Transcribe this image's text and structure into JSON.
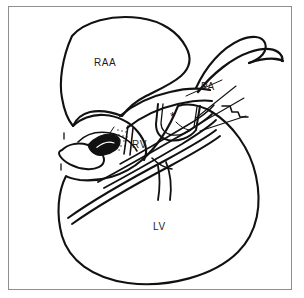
{
  "figure": {
    "kind": "medical-line-drawing",
    "background_color": "#ffffff",
    "ink_color": "#111111",
    "frame_color": "#8e8e8e",
    "label_color": "#1d1d1d"
  },
  "labels": [
    {
      "id": "raa",
      "text": "RAA",
      "meaning": "right-atrial-appendage"
    },
    {
      "id": "pa",
      "text": "PA",
      "meaning": "pulmonary-artery"
    },
    {
      "id": "rv",
      "text": "RV",
      "meaning": "right-ventricle"
    },
    {
      "id": "lv",
      "text": "LV",
      "meaning": "left-ventricle"
    }
  ],
  "markers": [
    {
      "id": "asterisk",
      "text": "*",
      "meaning": "site-of-interest-marker"
    }
  ],
  "icons": {
    "frame": "rectangle-frame-icon",
    "drawing": "heart-diagram-icon",
    "marker": "asterisk-marker-icon"
  }
}
